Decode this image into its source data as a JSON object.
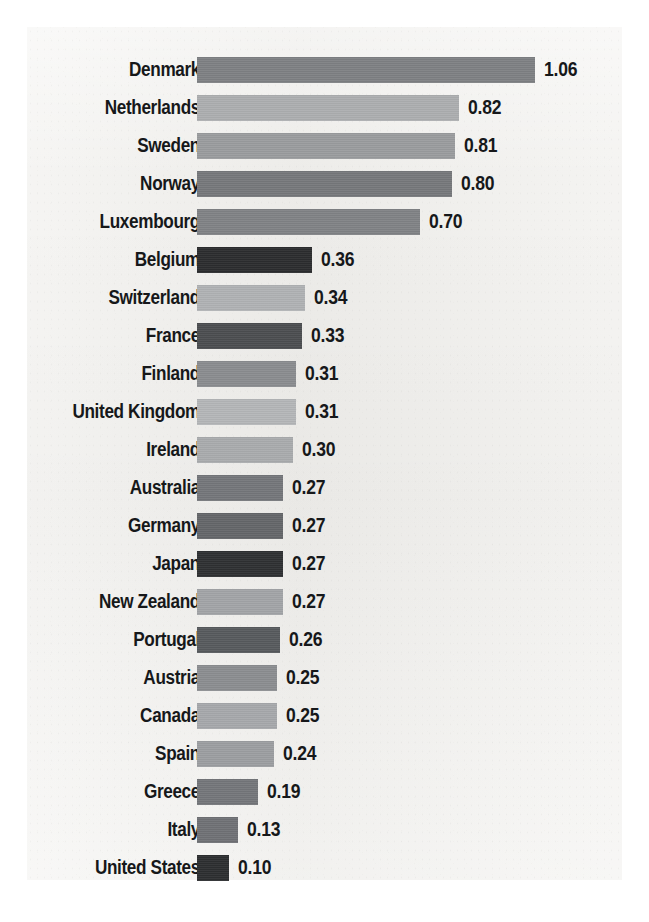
{
  "chart_data": {
    "type": "bar",
    "orientation": "horizontal",
    "title": "",
    "subtitle": "",
    "xlabel": "",
    "ylabel": "",
    "grid": false,
    "legend": null,
    "xlim": [
      0,
      1.06
    ],
    "value_format": "0.00",
    "categories": [
      "Denmark",
      "Netherlands",
      "Sweden",
      "Norway",
      "Luxembourg",
      "Belgium",
      "Switzerland",
      "France",
      "Finland",
      "United Kingdom",
      "Ireland",
      "Australia",
      "Germany",
      "Japan",
      "New Zealand",
      "Portugal",
      "Austria",
      "Canada",
      "Spain",
      "Greece",
      "Italy",
      "United States"
    ],
    "values": [
      1.06,
      0.82,
      0.81,
      0.8,
      0.7,
      0.36,
      0.34,
      0.33,
      0.31,
      0.31,
      0.3,
      0.27,
      0.27,
      0.27,
      0.27,
      0.26,
      0.25,
      0.25,
      0.24,
      0.19,
      0.13,
      0.1
    ],
    "value_labels": [
      "1.06",
      "0.82",
      "0.81",
      "0.80",
      "0.70",
      "0.36",
      "0.34",
      "0.33",
      "0.31",
      "0.31",
      "0.30",
      "0.27",
      "0.27",
      "0.27",
      "0.27",
      "0.26",
      "0.25",
      "0.25",
      "0.24",
      "0.19",
      "0.13",
      "0.10"
    ],
    "bar_colors": [
      "#7e8083",
      "#acaeb0",
      "#9a9c9e",
      "#76787b",
      "#808285",
      "#2b2c2e",
      "#b0b2b4",
      "#4b4d50",
      "#8a8c8f",
      "#b4b6b8",
      "#a9abad",
      "#74767a",
      "#646669",
      "#2e3032",
      "#a2a4a7",
      "#575a5d",
      "#8b8d90",
      "#a6a8ab",
      "#9c9ea1",
      "#74767a",
      "#6f7175",
      "#2c2e30"
    ]
  },
  "style": {
    "panel_background": "#f0efec",
    "page_background": "#ffffff",
    "text_color": "#16181a"
  },
  "layout": {
    "bar_origin_x_px": 170,
    "px_per_unit": 319,
    "bar_height_px": 26,
    "row_pitch_px": 38,
    "first_row_top_px": 30,
    "value_gap_px": 9
  }
}
